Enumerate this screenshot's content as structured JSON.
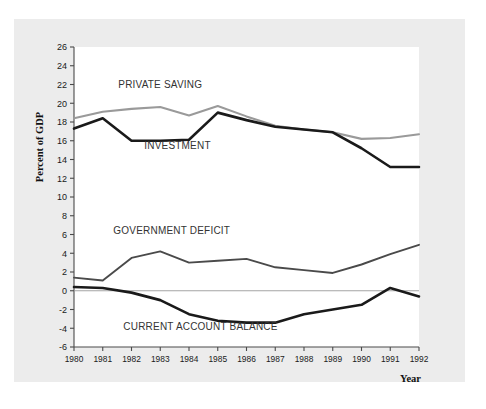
{
  "chart_data": {
    "type": "line",
    "title": "",
    "xlabel": "Year",
    "ylabel": "Percent of GDP",
    "grid": false,
    "legend_position": "inline-annotations",
    "categories": [
      1980,
      1981,
      1982,
      1983,
      1984,
      1985,
      1986,
      1987,
      1988,
      1989,
      1990,
      1991,
      1992
    ],
    "x": [
      1980,
      1981,
      1982,
      1983,
      1984,
      1985,
      1986,
      1987,
      1988,
      1989,
      1990,
      1991,
      1992
    ],
    "xlim": [
      1980,
      1992
    ],
    "ylim": [
      -6,
      26
    ],
    "ytick_step": 2,
    "yticks": [
      -6,
      -4,
      -2,
      0,
      2,
      4,
      6,
      8,
      10,
      12,
      14,
      16,
      18,
      20,
      22,
      24,
      26
    ],
    "ytick_labels": [
      "-6",
      "-4",
      "-2",
      "0",
      "2",
      "4",
      "6",
      "8",
      "10",
      "12",
      "14",
      "16",
      "18",
      "20",
      "22",
      "24",
      "26"
    ],
    "xtick_labels": [
      "1980",
      "1981",
      "1982",
      "1983",
      "1984",
      "1985",
      "1986",
      "1987",
      "1988",
      "1989",
      "1990",
      "1991",
      "1992"
    ],
    "series": [
      {
        "name": "PRIVATE SAVING",
        "color": "#9a9a9a",
        "width": 2.1,
        "label_x": 1983.0,
        "label_y": 21.6,
        "values": [
          18.4,
          19.1,
          19.4,
          19.6,
          18.7,
          19.7,
          18.6,
          17.6,
          17.2,
          16.9,
          16.2,
          16.3,
          16.7
        ]
      },
      {
        "name": "INVESTMENT",
        "color": "#1a1a1a",
        "width": 2.6,
        "label_x": 1983.6,
        "label_y": 15.1,
        "values": [
          17.3,
          18.4,
          16.0,
          16.0,
          16.1,
          19.0,
          18.2,
          17.5,
          17.2,
          16.9,
          15.2,
          13.2,
          13.2
        ]
      },
      {
        "name": "GOVERNMENT DEFICIT",
        "color": "#4a4a4a",
        "width": 1.9,
        "label_x": 1983.4,
        "label_y": 6.1,
        "values": [
          1.4,
          1.1,
          3.5,
          4.2,
          3.0,
          3.2,
          3.4,
          2.5,
          2.2,
          1.9,
          2.8,
          3.9,
          4.9
        ]
      },
      {
        "name": "CURRENT ACCOUNT BALANCE",
        "color": "#1a1a1a",
        "width": 2.6,
        "label_x": 1984.4,
        "label_y": -4.2,
        "values": [
          0.4,
          0.3,
          -0.2,
          -1.0,
          -2.5,
          -3.2,
          -3.4,
          -3.4,
          -2.5,
          -2.0,
          -1.5,
          0.3,
          -0.6
        ]
      }
    ]
  }
}
